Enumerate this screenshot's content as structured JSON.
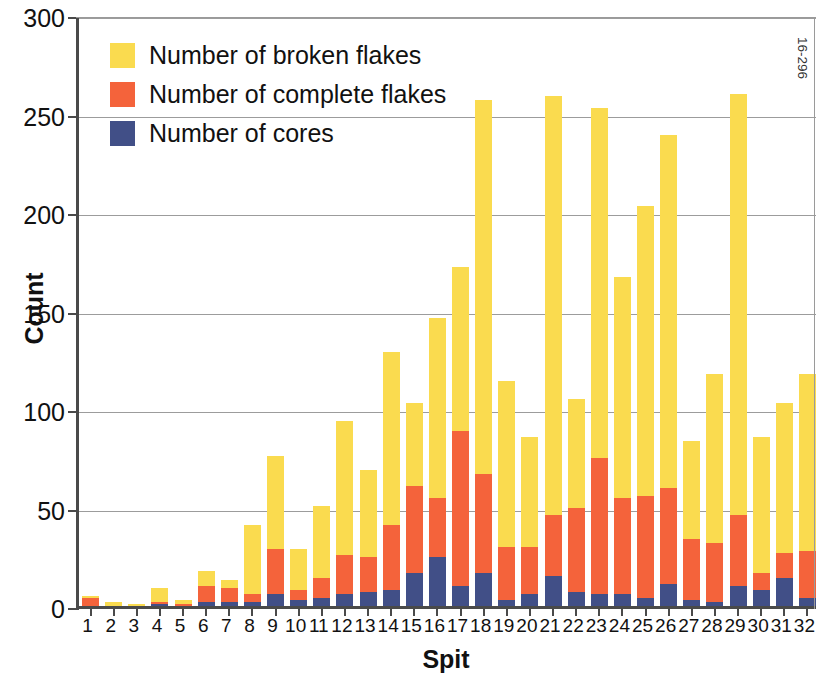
{
  "chart_data": {
    "type": "bar",
    "subtype": "stacked-bar",
    "title": "",
    "xlabel": "Spit",
    "ylabel": "Count",
    "ylim": [
      0,
      300
    ],
    "yticks": [
      0,
      50,
      100,
      150,
      200,
      250,
      300
    ],
    "grid": true,
    "legend_position": "top-left",
    "categories": [
      "1",
      "2",
      "3",
      "4",
      "5",
      "6",
      "7",
      "8",
      "9",
      "10",
      "11",
      "12",
      "13",
      "14",
      "15",
      "16",
      "17",
      "18",
      "19",
      "20",
      "21",
      "22",
      "23",
      "24",
      "25",
      "26",
      "27",
      "28",
      "29",
      "30",
      "31",
      "32"
    ],
    "series": [
      {
        "name": "Number of cores",
        "color": "#414f87",
        "values": [
          0,
          0,
          0,
          1,
          0,
          2,
          2,
          2,
          6,
          3,
          4,
          6,
          7,
          8,
          17,
          25,
          10,
          17,
          3,
          6,
          15,
          7,
          6,
          6,
          4,
          11,
          3,
          2,
          10,
          8,
          14,
          4
        ]
      },
      {
        "name": "Number of complete flakes",
        "color": "#f4633b",
        "values": [
          4,
          0,
          0,
          1,
          1,
          8,
          7,
          4,
          23,
          5,
          10,
          20,
          18,
          33,
          44,
          30,
          79,
          50,
          27,
          24,
          31,
          43,
          69,
          49,
          52,
          49,
          31,
          30,
          36,
          9,
          13,
          24
        ]
      },
      {
        "name": "Number of broken flakes",
        "color": "#fadb4f",
        "values": [
          1,
          2,
          1,
          7,
          2,
          8,
          4,
          35,
          47,
          21,
          37,
          68,
          44,
          88,
          42,
          91,
          83,
          190,
          84,
          56,
          213,
          55,
          178,
          112,
          147,
          179,
          50,
          86,
          214,
          69,
          76,
          90
        ]
      }
    ],
    "totals": [
      5,
      2,
      1,
      9,
      3,
      18,
      13,
      41,
      76,
      29,
      51,
      94,
      69,
      129,
      103,
      146,
      172,
      257,
      114,
      86,
      259,
      105,
      253,
      167,
      203,
      239,
      84,
      118,
      260,
      86,
      103,
      118
    ],
    "annotation": "16-296"
  },
  "axes": {
    "y_title": "Count",
    "x_title": "Spit",
    "y_tick_labels": [
      "0",
      "50",
      "100",
      "150",
      "200",
      "250",
      "300"
    ]
  },
  "legend": {
    "items": [
      {
        "label": "Number of broken flakes",
        "color": "#fadb4f"
      },
      {
        "label": "Number of complete flakes",
        "color": "#f4633b"
      },
      {
        "label": "Number of cores",
        "color": "#414f87"
      }
    ]
  },
  "corner": {
    "code": "16-296"
  }
}
